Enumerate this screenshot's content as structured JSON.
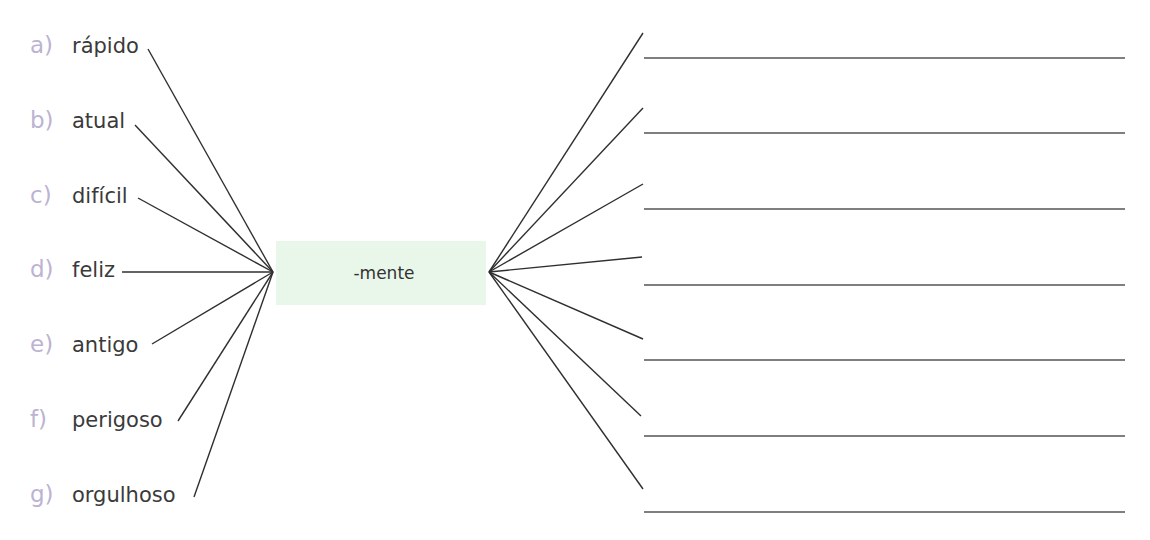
{
  "exercise": {
    "suffix": "-mente",
    "colors": {
      "letter": "#bcb3d3",
      "word": "#3a3a3a",
      "suffix_box": "#e8f7ea",
      "line": "#2f2f2f"
    },
    "items": [
      {
        "letter": "a)",
        "word": "rápido"
      },
      {
        "letter": "b)",
        "word": "atual"
      },
      {
        "letter": "c)",
        "word": "difícil"
      },
      {
        "letter": "d)",
        "word": "feliz"
      },
      {
        "letter": "e)",
        "word": "antigo"
      },
      {
        "letter": "f)",
        "word": "perigoso"
      },
      {
        "letter": "g)",
        "word": "orgulhoso"
      }
    ],
    "answers": [
      "",
      "",
      "",
      "",
      "",
      "",
      ""
    ]
  }
}
